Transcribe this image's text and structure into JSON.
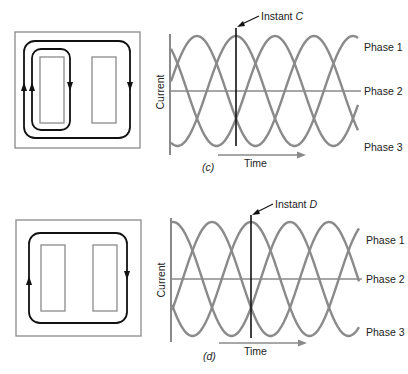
{
  "figures": [
    {
      "id": "c",
      "caption": "(c)",
      "instant_label_prefix": "Instant ",
      "instant_label_letter": "C",
      "y_axis_label": "Current",
      "x_axis_label": "Time",
      "legend": [
        "Phase 1",
        "Phase 2",
        "Phase 3"
      ],
      "core_flux_paths": "two loops: inner loop around left window, outer loop around both windows"
    },
    {
      "id": "d",
      "caption": "(d)",
      "instant_label_prefix": "Instant ",
      "instant_label_letter": "D",
      "y_axis_label": "Current",
      "x_axis_label": "Time",
      "legend": [
        "Phase 1",
        "Phase 2",
        "Phase 3"
      ],
      "core_flux_paths": "single loop around both windows"
    }
  ],
  "colors": {
    "waveform": "#8a8a8a",
    "axis": "#8a8a8a",
    "instant_line": "#111111",
    "flux_path": "#111111",
    "core_outline": "#8a8a8a"
  },
  "chart_data": [
    {
      "type": "line",
      "title": "(c)",
      "xlabel": "Time",
      "ylabel": "Current",
      "series": [
        {
          "name": "Phase 1",
          "phase_deg": 0
        },
        {
          "name": "Phase 2",
          "phase_deg": 120
        },
        {
          "name": "Phase 3",
          "phase_deg": 240
        }
      ],
      "annotation": "Instant C",
      "cycles_shown": 1.6
    },
    {
      "type": "line",
      "title": "(d)",
      "xlabel": "Time",
      "ylabel": "Current",
      "series": [
        {
          "name": "Phase 1",
          "phase_deg": 0
        },
        {
          "name": "Phase 2",
          "phase_deg": 120
        },
        {
          "name": "Phase 3",
          "phase_deg": 240
        }
      ],
      "annotation": "Instant D",
      "cycles_shown": 1.6
    }
  ]
}
